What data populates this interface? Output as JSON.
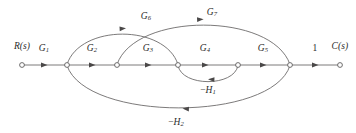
{
  "figure": {
    "type": "signal-flow-graph",
    "background_color": "#ffffff",
    "line_color": "#6d6b6b",
    "text_color": "#2b2b2b",
    "width": 356,
    "height": 133
  },
  "nodes": [
    {
      "id": "n0",
      "label": "R(s)",
      "x": 22,
      "y": 65,
      "label_x": 22,
      "label_y": 46
    },
    {
      "id": "n1",
      "label": "",
      "x": 67,
      "y": 65,
      "label_x": 67,
      "label_y": 46
    },
    {
      "id": "n2",
      "label": "",
      "x": 117,
      "y": 65,
      "label_x": 117,
      "label_y": 46
    },
    {
      "id": "n3",
      "label": "",
      "x": 178,
      "y": 65,
      "label_x": 178,
      "label_y": 46
    },
    {
      "id": "n4",
      "label": "",
      "x": 238,
      "y": 65,
      "label_x": 238,
      "label_y": 46
    },
    {
      "id": "n5",
      "label": "",
      "x": 290,
      "y": 65,
      "label_x": 290,
      "label_y": 46
    },
    {
      "id": "n6",
      "label": "C(s)",
      "x": 340,
      "y": 65,
      "label_x": 340,
      "label_y": 46
    }
  ],
  "edges": [
    {
      "id": "e-g1",
      "gain_base": "G",
      "gain_sub": "1",
      "from": "n0",
      "to": "n1",
      "shape": "straight",
      "label_x": 44,
      "label_y": 48,
      "sign": ""
    },
    {
      "id": "e-g2",
      "gain_base": "G",
      "gain_sub": "2",
      "from": "n1",
      "to": "n2",
      "shape": "straight",
      "label_x": 92,
      "label_y": 48,
      "sign": ""
    },
    {
      "id": "e-g3",
      "gain_base": "G",
      "gain_sub": "3",
      "from": "n2",
      "to": "n3",
      "shape": "straight",
      "label_x": 148,
      "label_y": 48,
      "sign": ""
    },
    {
      "id": "e-g4",
      "gain_base": "G",
      "gain_sub": "4",
      "from": "n3",
      "to": "n4",
      "shape": "straight",
      "label_x": 205,
      "label_y": 48,
      "sign": ""
    },
    {
      "id": "e-g5",
      "gain_base": "G",
      "gain_sub": "5",
      "from": "n4",
      "to": "n5",
      "shape": "straight",
      "label_x": 263,
      "label_y": 48,
      "sign": ""
    },
    {
      "id": "e-one",
      "gain_base": "1",
      "gain_sub": "",
      "from": "n5",
      "to": "n6",
      "shape": "straight",
      "label_x": 315,
      "label_y": 48,
      "sign": ""
    },
    {
      "id": "e-g6",
      "gain_base": "G",
      "gain_sub": "6",
      "from": "n1",
      "to": "n3",
      "shape": "arc-above",
      "label_x": 146,
      "label_y": 16,
      "sign": ""
    },
    {
      "id": "e-g7",
      "gain_base": "G",
      "gain_sub": "7",
      "from": "n2",
      "to": "n5",
      "shape": "arc-above",
      "label_x": 212,
      "label_y": 12,
      "sign": ""
    },
    {
      "id": "e-h1",
      "gain_base": "H",
      "gain_sub": "1",
      "from": "n4",
      "to": "n3",
      "shape": "arc-below",
      "label_x": 208,
      "label_y": 90,
      "sign": "−"
    },
    {
      "id": "e-h2",
      "gain_base": "H",
      "gain_sub": "2",
      "from": "n5",
      "to": "n1",
      "shape": "arc-below",
      "label_x": 176,
      "label_y": 122,
      "sign": "−"
    }
  ],
  "geometry": {
    "main_line_y": 65,
    "node_radius": 2.4,
    "g6_arc_peak_y": 25,
    "g7_arc_peak_y": 20,
    "h1_arc_dip_y": 81,
    "h2_arc_dip_y": 113
  }
}
